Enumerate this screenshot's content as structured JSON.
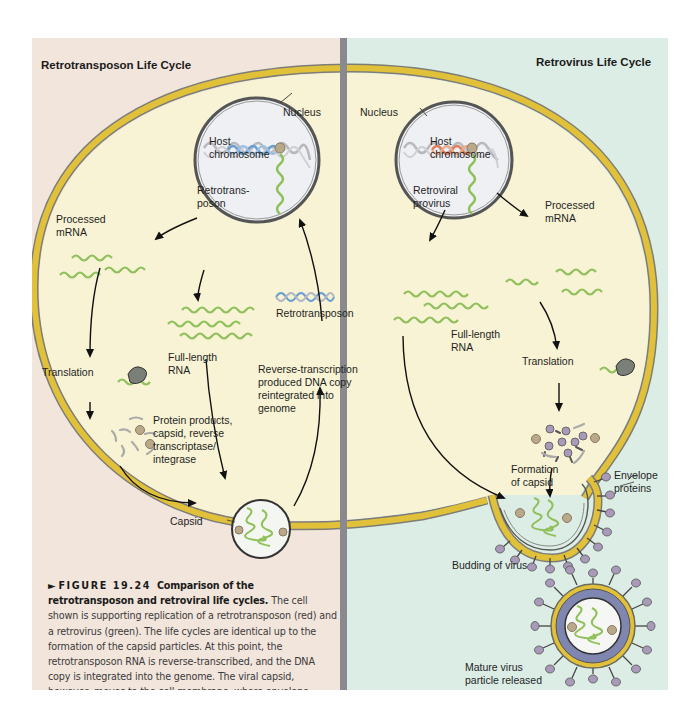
{
  "figure": {
    "left_panel": {
      "title": "Retrotransposon Life Cycle",
      "background": "#f2e5dc",
      "labels": {
        "nucleus": "Nucleus",
        "host_chromosome": "Host\nchromosome",
        "retrotransposon_in_nucleus": "Retrotrans-\nposon",
        "processed_mrna": "Processed\nmRNA",
        "retrotransposon_dna": "Retrotransposon",
        "full_length_rna": "Full-length\nRNA",
        "translation": "Translation",
        "reverse_transcription": "Reverse-transcription\nproduced DNA copy\nreintegrated into\ngenome",
        "protein_products": "Protein products,\ncapsid, reverse\ntranscriptase/\nintegrase",
        "capsid": "Capsid"
      }
    },
    "right_panel": {
      "title": "Retrovirus Life Cycle",
      "background": "#dcede6",
      "labels": {
        "nucleus": "Nucleus",
        "host_chromosome": "Host\nchromosome",
        "retroviral_provirus": "Retroviral\nprovirus",
        "processed_mrna": "Processed\nmRNA",
        "full_length_rna": "Full-length\nRNA",
        "translation": "Translation",
        "formation_of_capsid": "Formation\nof capsid",
        "envelope_proteins": "Envelope\nproteins",
        "budding_of_virus": "Budding of virus",
        "mature_virus": "Mature virus\nparticle released"
      }
    },
    "caption": {
      "marker": "►",
      "figure_number": "FIGURE 19.24",
      "title": "Comparison of the retrotransposon and retroviral life cycles.",
      "body": "The cell shown is supporting replication of a retrotransposon (red) and a retrovirus (green). The life cycles are identical up to the formation of the capsid particles. At this point, the retrotransposon RNA is reverse-transcribed, and the DNA copy is integrated into the genome. The viral capsid, however, moves to the cell membrane, where envelope proteins have attached and the mature particle buds out from the cell."
    },
    "colors": {
      "membrane": "#e2c13a",
      "membrane_outline": "#7d7d78",
      "cytoplasm": "#f7f3d4",
      "nucleus_fill": "#eef0f4",
      "rna": "#8fc05a",
      "retrotransposon_dna": "#6a9fd0",
      "provirus_dna": "#e0805a",
      "host_dna": "#b8b8bc",
      "envelope_protein": "#a89ab8",
      "matrix": "#7f86b0",
      "divider": "#8a8a8e"
    }
  }
}
